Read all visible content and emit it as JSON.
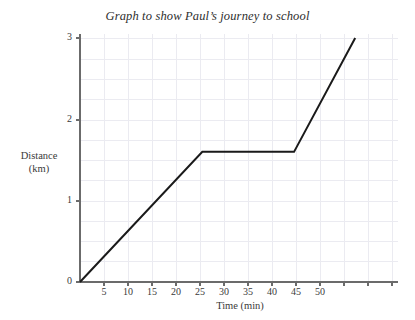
{
  "chart_data": {
    "type": "line",
    "title": "Graph to show Paul’s journey to school",
    "xlabel": "Time (min)",
    "ylabel_line1": "Distance",
    "ylabel_line2": "(km)",
    "ylabel": "Distance (km)",
    "xlim": [
      0,
      52
    ],
    "ylim": [
      0,
      3.1
    ],
    "xticks": [
      5,
      10,
      15,
      20,
      25,
      30,
      35,
      40,
      45,
      50
    ],
    "xtick_labels": [
      "5",
      "10",
      "15",
      "20",
      "25",
      "30",
      "35",
      "40",
      "45",
      "50"
    ],
    "yticks": [
      0,
      1,
      2,
      3
    ],
    "ytick_labels": [
      "0",
      "1",
      "2",
      "3"
    ],
    "grid": true,
    "grid_x_step": 5,
    "grid_y_step": 0.25,
    "legend": null,
    "series": [
      {
        "name": "Paul's journey",
        "color": "#1a1a1a",
        "line_width": 2,
        "x": [
          0,
          20,
          35,
          45
        ],
        "y": [
          0,
          1.6,
          1.6,
          3.0
        ],
        "segments": [
          {
            "from_min": 0,
            "to_min": 20,
            "from_km": 0,
            "to_km": 1.6,
            "description": "travelling"
          },
          {
            "from_min": 20,
            "to_min": 35,
            "from_km": 1.6,
            "to_km": 1.6,
            "description": "stationary"
          },
          {
            "from_min": 35,
            "to_min": 45,
            "from_km": 1.6,
            "to_km": 3.0,
            "description": "travelling"
          }
        ]
      }
    ]
  },
  "colors": {
    "line": "#1a1a1a",
    "axis": "#555555",
    "grid": "#e9e9ef",
    "text": "#3a3a3a",
    "background": "#ffffff"
  }
}
